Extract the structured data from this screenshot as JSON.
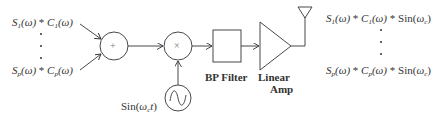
{
  "inputs": {
    "first": {
      "s": "S",
      "s_sub": "1",
      "omega": "(ω)",
      "op": " * ",
      "c": "C",
      "c_sub": "1",
      "omega2": "(ω)"
    },
    "last": {
      "s": "S",
      "s_sub": "p",
      "omega": "(ω)",
      "op": " * ",
      "c": "C",
      "c_sub": "p",
      "omega2": "(ω)"
    }
  },
  "blocks": {
    "sum_symbol": "+",
    "mult_symbol": "×",
    "oscillator_label_pre": "Sin(",
    "oscillator_label_omega": "ω",
    "oscillator_label_sub": "c",
    "oscillator_label_t": "t",
    "oscillator_label_post": ")",
    "bp_filter": "BP Filter",
    "amp_line1": "Linear",
    "amp_line2": "Amp"
  },
  "outputs": {
    "first": {
      "s": "S",
      "s_sub": "1",
      "omega": "(ω)",
      "op": " * ",
      "c": "C",
      "c_sub": "1",
      "omega2": "(ω)",
      "op2": " * ",
      "sin": "Sin(",
      "w": "ω",
      "w_sub": "c",
      "close": ")"
    },
    "last": {
      "s": "S",
      "s_sub": "p",
      "omega": "(ω)",
      "op": " * ",
      "c": "C",
      "c_sub": "p",
      "omega2": "(ω)",
      "op2": " * ",
      "sin": "Sin(",
      "w": "ω",
      "w_sub": "c",
      "close": ")"
    }
  },
  "colors": {
    "stroke": "#333333",
    "background": "#ffffff"
  }
}
